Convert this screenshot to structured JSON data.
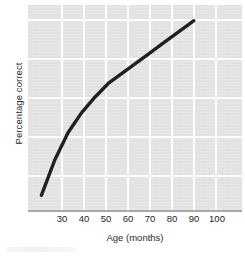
{
  "chart_data": {
    "type": "line",
    "title": "",
    "xlabel": "Age (months)",
    "ylabel": "Percentage correct",
    "xlim": [
      25,
      105
    ],
    "ylim": [
      0,
      105
    ],
    "xticks": [
      30,
      40,
      50,
      60,
      70,
      80,
      90,
      100
    ],
    "yticks": [
      20,
      40,
      60,
      80,
      100
    ],
    "grid": true,
    "legend": "none",
    "series": [
      {
        "name": "Percentage correct by age",
        "color": "#231f20",
        "x": [
          30,
          35,
          40,
          45,
          50,
          55,
          60,
          65,
          70,
          75,
          80,
          85,
          87
        ],
        "y": [
          8,
          26,
          40,
          50,
          58,
          65,
          70,
          75,
          80,
          85,
          90,
          95,
          97
        ]
      }
    ]
  },
  "axes": {
    "y_title": "Percentage correct",
    "x_title": "Age (months)",
    "y_tick_labels": [
      "100",
      "80",
      "60",
      "40",
      "20"
    ],
    "x_tick_labels": [
      "30",
      "40",
      "50",
      "60",
      "70",
      "80",
      "90",
      "100"
    ]
  },
  "colors": {
    "plot_background": "#e3e3e3",
    "gridline": "#fdfdfd",
    "curve": "#231f20",
    "axis_line": "#a9a9a9",
    "text": "#1d1d1d"
  }
}
